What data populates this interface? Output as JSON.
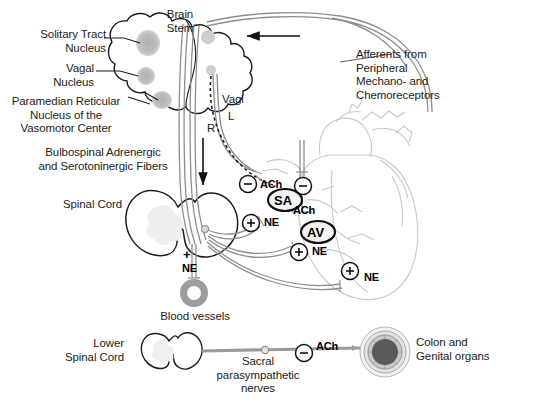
{
  "figure": {
    "background_color": "#ffffff",
    "ink_color": "#1c1c1c",
    "nucleus_fill": "#b9b9b9",
    "heart_outline_color": "#c8c8c8",
    "nerve_fill": "#d8d8d8",
    "organ_dark": "#555555"
  },
  "labels": {
    "solitary_tract_nucleus": "Solitary Tract\nNucleus",
    "vagal_nucleus": "Vagal\nNucleus",
    "paramedian": "Paramedian Reticular\nNucleus of the\nVasomotor Center",
    "bulbospinal": "Bulbospinal Adrenergic\nand Serotoninergic Fibers",
    "spinal_cord": "Spinal Cord",
    "brain_stem": "Brain\nStem",
    "afferents": "Afferents from\nPeripheral\nMechano- and\nChemoreceptors",
    "vagi": "Vagi",
    "vagus_left": "L",
    "vagus_right": "R",
    "blood_vessels": "Blood vessels",
    "lower_spinal_cord": "Lower\nSpinal Cord",
    "sacral_nerves": "Sacral\nparasympathetic\nnerves",
    "colon_genital": "Colon and\nGenital organs"
  },
  "nodes": [
    {
      "id": "sa-node",
      "label": "SA"
    },
    {
      "id": "av-node",
      "label": "AV"
    }
  ],
  "neurotransmitters": [
    {
      "id": "ach-sa",
      "label": "ACh",
      "sign": "-",
      "target": "SA node (vagal)"
    },
    {
      "id": "ach-av",
      "label": "ACh",
      "sign": "-",
      "target": "AV node (vagal)"
    },
    {
      "id": "ne-sa",
      "label": "NE",
      "sign": "+",
      "target": "SA node (sympathetic)"
    },
    {
      "id": "ne-av",
      "label": "NE",
      "sign": "+",
      "target": "AV node (sympathetic)"
    },
    {
      "id": "ne-myocard",
      "label": "NE",
      "sign": "+",
      "target": "Ventricular myocardium"
    },
    {
      "id": "ne-vessels",
      "label": "NE",
      "sign": "+",
      "target": "Blood vessels"
    },
    {
      "id": "ach-pelvic",
      "label": "ACh",
      "sign": "-",
      "target": "Colon and genital organs"
    }
  ],
  "signs": {
    "minus": "–",
    "plus": "+"
  }
}
